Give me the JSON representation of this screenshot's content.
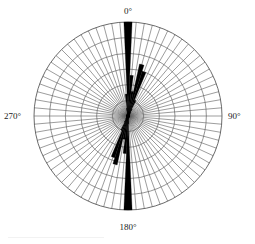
{
  "figure": {
    "name": "rose-diagram",
    "background": "#ffffff",
    "ink": "#000000",
    "grid_color": "#5a5a5a",
    "label_color": "#1a1a1a"
  },
  "axis_labels": {
    "north": "0°",
    "east": "90°",
    "south": "180°",
    "west": "270°"
  },
  "chart_data": {
    "type": "bar",
    "subtype": "rose-diagram",
    "title": "",
    "xlabel": "",
    "ylabel": "",
    "orientation": "clockwise-from-north",
    "bin_width_deg": 5,
    "n_bins": 72,
    "grid": true,
    "grid_rings": 6,
    "rlim": [
      0,
      6
    ],
    "center_px": [
      128,
      116
    ],
    "outer_radius_px": 94,
    "tick_labels": [
      "0°",
      "90°",
      "180°",
      "270°"
    ],
    "tick_angles": [
      0,
      90,
      180,
      270
    ],
    "legend": [],
    "annotations": [],
    "categories": [
      "0",
      "5",
      "10",
      "15",
      "20",
      "25",
      "30",
      "35",
      "40",
      "45",
      "50",
      "55",
      "60",
      "65",
      "70",
      "75",
      "80",
      "85",
      "90",
      "95",
      "100",
      "105",
      "110",
      "115",
      "120",
      "125",
      "130",
      "135",
      "140",
      "145",
      "150",
      "155",
      "160",
      "165",
      "170",
      "175",
      "180",
      "185",
      "190",
      "195",
      "200",
      "205",
      "210",
      "215",
      "220",
      "225",
      "230",
      "235",
      "240",
      "245",
      "250",
      "255",
      "260",
      "265",
      "270",
      "275",
      "280",
      "285",
      "290",
      "295",
      "300",
      "305",
      "310",
      "315",
      "320",
      "325",
      "330",
      "335",
      "340",
      "345",
      "350",
      "355"
    ],
    "values": [
      6.0,
      2.6,
      1.6,
      3.4,
      3.0,
      1.1,
      0.5,
      0.3,
      0.2,
      0.2,
      0.15,
      0.12,
      0.1,
      0.1,
      0.1,
      0.1,
      0.1,
      0.1,
      0.1,
      0.1,
      0.1,
      0.1,
      0.1,
      0.1,
      0.1,
      0.1,
      0.1,
      0.1,
      0.1,
      0.1,
      0.1,
      0.1,
      0.1,
      0.12,
      0.2,
      0.5,
      6.0,
      2.4,
      1.5,
      3.2,
      2.8,
      1.0,
      0.45,
      0.25,
      0.2,
      0.15,
      0.12,
      0.1,
      0.1,
      0.1,
      0.1,
      0.1,
      0.1,
      0.1,
      0.1,
      0.1,
      0.1,
      0.1,
      0.1,
      0.1,
      0.1,
      0.1,
      0.1,
      0.1,
      0.1,
      0.1,
      0.1,
      0.1,
      0.12,
      0.2,
      0.5,
      1.4
    ]
  }
}
